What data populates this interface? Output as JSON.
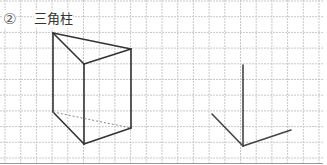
{
  "problem": {
    "number": "②",
    "title": "三角柱"
  },
  "grid": {
    "origin_x": 5,
    "origin_y": 1,
    "spacing": 15.7,
    "cols": 20,
    "rows": 10,
    "line_color": "#c8c8c8",
    "border_color": "#999999"
  },
  "prism": {
    "visible_edges": [
      [
        [
          53,
          33
        ],
        [
          131,
          49
        ]
      ],
      [
        [
          53,
          33
        ],
        [
          84,
          64
        ]
      ],
      [
        [
          84,
          64
        ],
        [
          131,
          49
        ]
      ],
      [
        [
          53,
          33
        ],
        [
          53,
          112
        ]
      ],
      [
        [
          84,
          64
        ],
        [
          84,
          144
        ]
      ],
      [
        [
          131,
          49
        ],
        [
          131,
          128
        ]
      ],
      [
        [
          53,
          112
        ],
        [
          84,
          144
        ]
      ],
      [
        [
          84,
          144
        ],
        [
          131,
          128
        ]
      ]
    ],
    "hidden_edges": [
      [
        [
          53,
          112
        ],
        [
          131,
          128
        ]
      ]
    ],
    "stroke_color": "#333333"
  },
  "axes": {
    "corner": [
      243,
      146
    ],
    "vertical_end": [
      243,
      65
    ],
    "left_end": [
      212,
      114
    ],
    "right_end": [
      291,
      130
    ],
    "stroke_color": "#444444"
  }
}
